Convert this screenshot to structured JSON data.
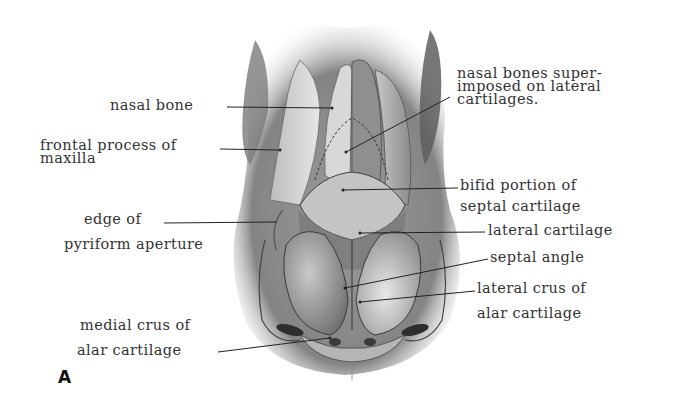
{
  "figure": {
    "letter": "A"
  },
  "labels": [
    {
      "id": "nasal-bone",
      "lines": [
        "nasal bone"
      ]
    },
    {
      "id": "frontal-process",
      "lines": [
        "frontal process of",
        "maxilla"
      ]
    },
    {
      "id": "edge-pyriform",
      "lines": [
        "edge of",
        "pyriform aperture"
      ]
    },
    {
      "id": "medial-crus",
      "lines": [
        "medial crus of",
        "alar cartilage"
      ]
    },
    {
      "id": "nasal-bones-superimposed",
      "lines": [
        "nasal bones super-",
        "imposed on lateral",
        "cartilages."
      ]
    },
    {
      "id": "bifid-portion",
      "lines": [
        "bifid portion of",
        "septal cartilage"
      ]
    },
    {
      "id": "lateral-cartilage",
      "lines": [
        "lateral cartilage"
      ]
    },
    {
      "id": "septal-angle",
      "lines": [
        "septal angle"
      ]
    },
    {
      "id": "lateral-crus",
      "lines": [
        "lateral crus of",
        "alar cartilage"
      ]
    }
  ],
  "colors": {
    "background": "#ffffff",
    "ink": "#2a2a2a",
    "shade_dark": "#5a5a5a",
    "shade_mid": "#9a9a9a",
    "shade_light": "#d4d4d4"
  }
}
